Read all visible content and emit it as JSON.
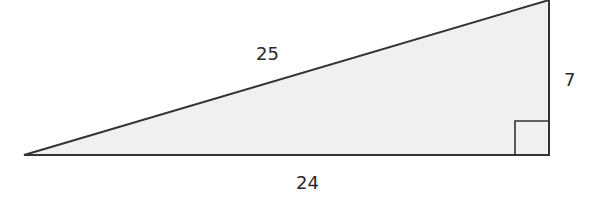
{
  "diagram": {
    "type": "right-triangle",
    "fill_color": "#f0f0f0",
    "stroke_color": "#333333",
    "sides": {
      "hypotenuse": "25",
      "vertical_leg": "7",
      "horizontal_leg": "24"
    },
    "right_angle_marker": true
  }
}
